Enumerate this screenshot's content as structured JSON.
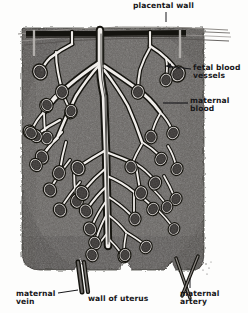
{
  "labels": {
    "placental_wall": "placental wall",
    "fetal_blood_vessels": "fetal blood\nvessels",
    "maternal_blood": "maternal\nblood",
    "maternal_vein": "maternal\nvein",
    "wall_of_uterus": "wall of uterus",
    "maternal_artery": "maternal\nartery"
  },
  "colors": {
    "page_background": "#fdfdfc",
    "maternal_blood_fill": "#6d6a67",
    "maternal_blood_dark": "#4e4b49",
    "placental_wall_band": "#14130f",
    "vessel_outline": "#1b1a18",
    "vessel_fill": "#efeceb",
    "villus_fill": "#55524f",
    "label_text": "#17171a",
    "leader_line": "#17171a"
  },
  "structures": {
    "chorionic_plate": "thin curved lines at top",
    "trunk": "central stem vessel descending from placental wall",
    "villi_count": 34,
    "maternal_vein_position": "bottom left",
    "maternal_artery_position": "bottom right"
  }
}
